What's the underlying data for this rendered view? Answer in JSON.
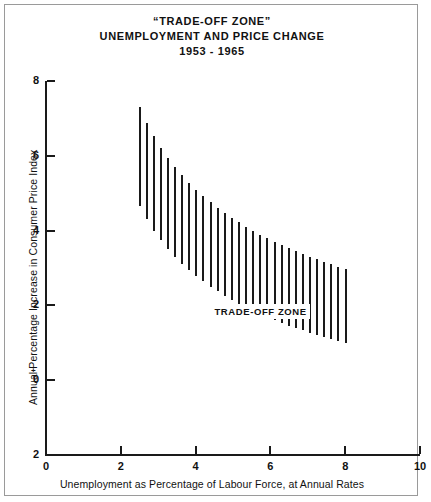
{
  "title": {
    "line1": "“TRADE-OFF ZONE”",
    "line2": "UNEMPLOYMENT AND PRICE CHANGE",
    "line3": "1953 - 1965"
  },
  "annotation": {
    "zone_label": "TRADE-OFF ZONE"
  },
  "signs": {
    "plus": "+",
    "minus": "−"
  },
  "chart_data": {
    "type": "area",
    "title": "“TRADE-OFF ZONE” UNEMPLOYMENT AND PRICE CHANGE 1953 - 1965",
    "subtitle": "1953 - 1965",
    "xlabel": "Unemployment as Percentage of Labour Force, at Annual Rates",
    "ylabel": "Annual Percentage Increase in Consumer Price Index",
    "xlim": [
      0,
      10
    ],
    "ylim": [
      -2,
      8
    ],
    "xticks": [
      0,
      2,
      4,
      6,
      8,
      10
    ],
    "xticklabels": [
      "0",
      "2",
      "4",
      "6",
      "8",
      "10"
    ],
    "yticks": [
      8,
      6,
      4,
      2,
      0,
      -2
    ],
    "yticklabels": [
      "8",
      "6",
      "4",
      "2",
      "0",
      "2"
    ],
    "grid": false,
    "legend": null,
    "annotations": [
      {
        "text": "TRADE-OFF ZONE",
        "x": 5.6,
        "y": 1.85
      }
    ],
    "series": [
      {
        "name": "Trade-off zone band (vertical hatch bars)",
        "note": "Each bar spans from the lower boundary to the upper boundary of the trade-off zone at that unemployment rate.",
        "x": [
          2.5,
          2.69,
          2.88,
          3.07,
          3.26,
          3.45,
          3.64,
          3.83,
          4.02,
          4.21,
          4.4,
          4.59,
          4.78,
          4.97,
          5.16,
          5.35,
          5.54,
          5.73,
          5.92,
          6.11,
          6.3,
          6.49,
          6.68,
          6.87,
          7.06,
          7.25,
          7.44,
          7.63,
          7.82,
          8.01
        ],
        "upper": [
          7.3,
          6.88,
          6.52,
          6.22,
          5.95,
          5.7,
          5.48,
          5.28,
          5.09,
          4.92,
          4.76,
          4.61,
          4.47,
          4.34,
          4.22,
          4.1,
          3.99,
          3.89,
          3.79,
          3.7,
          3.61,
          3.53,
          3.45,
          3.37,
          3.3,
          3.23,
          3.16,
          3.1,
          3.04,
          2.98
        ],
        "lower": [
          4.65,
          4.3,
          4.0,
          3.74,
          3.51,
          3.3,
          3.11,
          2.94,
          2.78,
          2.64,
          2.5,
          2.38,
          2.26,
          2.15,
          2.05,
          1.95,
          1.86,
          1.77,
          1.69,
          1.61,
          1.53,
          1.46,
          1.39,
          1.33,
          1.27,
          1.21,
          1.15,
          1.1,
          1.05,
          1.0
        ]
      }
    ]
  }
}
